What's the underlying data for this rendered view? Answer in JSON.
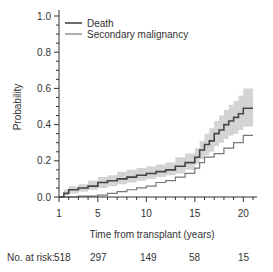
{
  "chart_data": {
    "type": "line",
    "title": "",
    "xlabel": "Time from transplant (years)",
    "ylabel": "Probability",
    "xlim": [
      1,
      21
    ],
    "ylim": [
      0,
      1.0
    ],
    "x_ticks": [
      1,
      5,
      10,
      15,
      20
    ],
    "y_ticks": [
      0.0,
      0.2,
      0.4,
      0.6,
      0.8,
      1.0
    ],
    "y_tick_labels": [
      "0.0",
      "0.2",
      "0.4",
      "0.6",
      "0.8",
      "1.0"
    ],
    "grid": false,
    "legend_position": "top-left",
    "series": [
      {
        "name": "Death",
        "color": "#444444",
        "step": true,
        "x": [
          1,
          1.5,
          2,
          3,
          4,
          5,
          6,
          7,
          8,
          9,
          10,
          11,
          12,
          13,
          14,
          15,
          15.5,
          16,
          16.5,
          17,
          17.5,
          18,
          18.5,
          19,
          19.5,
          20,
          21
        ],
        "values": [
          0.0,
          0.02,
          0.04,
          0.05,
          0.06,
          0.08,
          0.09,
          0.1,
          0.11,
          0.12,
          0.13,
          0.14,
          0.15,
          0.17,
          0.19,
          0.22,
          0.26,
          0.29,
          0.31,
          0.35,
          0.37,
          0.4,
          0.42,
          0.44,
          0.46,
          0.49,
          0.49
        ],
        "ci_lower": [
          0.0,
          0.01,
          0.02,
          0.03,
          0.04,
          0.05,
          0.06,
          0.07,
          0.08,
          0.09,
          0.1,
          0.11,
          0.12,
          0.13,
          0.15,
          0.18,
          0.21,
          0.23,
          0.25,
          0.28,
          0.3,
          0.32,
          0.34,
          0.35,
          0.37,
          0.39,
          0.39
        ],
        "ci_upper": [
          0.0,
          0.04,
          0.06,
          0.07,
          0.09,
          0.11,
          0.12,
          0.14,
          0.15,
          0.16,
          0.17,
          0.18,
          0.19,
          0.22,
          0.24,
          0.27,
          0.31,
          0.35,
          0.38,
          0.42,
          0.45,
          0.48,
          0.51,
          0.53,
          0.56,
          0.6,
          0.6
        ]
      },
      {
        "name": "Secondary malignancy",
        "color": "#777777",
        "step": true,
        "x": [
          1,
          3,
          5,
          6,
          7,
          8,
          9,
          10,
          11,
          12,
          13,
          14,
          15,
          15.5,
          16,
          17,
          18,
          19,
          20,
          21
        ],
        "values": [
          0.0,
          0.005,
          0.01,
          0.02,
          0.03,
          0.04,
          0.05,
          0.06,
          0.08,
          0.09,
          0.11,
          0.13,
          0.16,
          0.19,
          0.22,
          0.24,
          0.27,
          0.3,
          0.34,
          0.34
        ]
      }
    ]
  },
  "risk_table": {
    "label": "No. at risk:",
    "values": [
      "518",
      "297",
      "149",
      "58",
      "15"
    ]
  }
}
